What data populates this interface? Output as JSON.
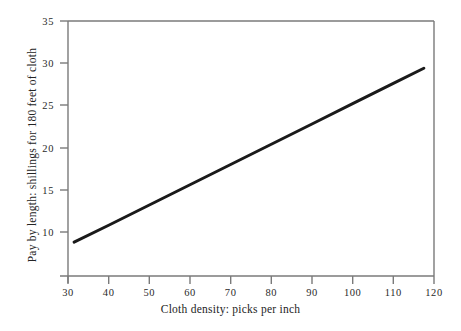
{
  "chart_data": {
    "type": "line",
    "title": "",
    "subtitle": "",
    "xlabel": "Cloth density: picks per inch",
    "ylabel": "Pay by length: shillings for 180 feet of cloth",
    "xlim": [
      30,
      120
    ],
    "ylim": [
      4.8,
      35
    ],
    "xticks": [
      30,
      40,
      50,
      60,
      70,
      80,
      90,
      100,
      110,
      120
    ],
    "yticks": [
      10,
      15,
      20,
      25,
      30,
      35
    ],
    "xtick_labels": [
      "30",
      "40",
      "50",
      "60",
      "70",
      "80",
      "90",
      "100",
      "110",
      "120"
    ],
    "ytick_labels": [
      "10",
      "15",
      "20",
      "25",
      "30",
      "35"
    ],
    "grid": false,
    "legend": "none",
    "series": [
      {
        "name": "Pay by length",
        "color": "#1a1a1a",
        "line_width": 3,
        "x": [
          31.5,
          117.5
        ],
        "y": [
          8.8,
          29.4
        ],
        "points": [
          {
            "x": 31.5,
            "y": 8.8
          },
          {
            "x": 40,
            "y": 10.8
          },
          {
            "x": 50,
            "y": 13.2
          },
          {
            "x": 60,
            "y": 15.6
          },
          {
            "x": 70,
            "y": 18.0
          },
          {
            "x": 80,
            "y": 20.4
          },
          {
            "x": 90,
            "y": 22.8
          },
          {
            "x": 100,
            "y": 25.2
          },
          {
            "x": 110,
            "y": 27.6
          },
          {
            "x": 117.5,
            "y": 29.4
          }
        ]
      }
    ],
    "axis_frame": {
      "left": true,
      "bottom": true,
      "top": true,
      "right": true,
      "color": "#7a7a7a"
    }
  },
  "colors": {
    "background": "#ffffff",
    "line": "#1a1a1a",
    "axis": "#7a7a7a",
    "text": "#242424"
  }
}
